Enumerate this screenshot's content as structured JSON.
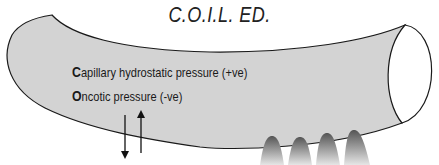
{
  "title": "C.O.I.L. ED.",
  "labels": {
    "capillary": {
      "initial": "C",
      "rest": "apillary hydrostatic pressure (+ve)"
    },
    "oncotic": {
      "initial": "O",
      "rest": "ncotic pressure (-ve)"
    }
  },
  "colors": {
    "vessel_fill": "#d3d3d3",
    "outline": "#1a1a1a",
    "background": "#ffffff"
  }
}
